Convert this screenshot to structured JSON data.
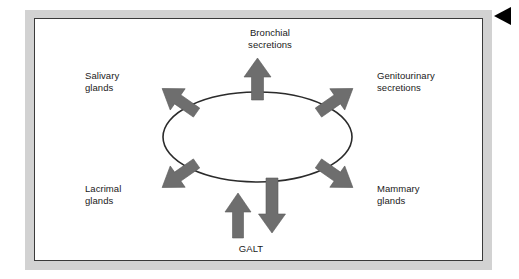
{
  "figure": {
    "type": "radial-diagram",
    "title": "",
    "center_node": {
      "name": "central-ellipse",
      "label": "",
      "shape": "ellipse",
      "fill": "#ffffff",
      "stroke": "#2b2b2b"
    },
    "colors": {
      "arrow_fill": "#6e6e6e",
      "arrow_stroke": "#555555",
      "outline": "#2b2b2b",
      "frame_mat": "#d2d2d2",
      "panel_background": "#ffffff",
      "text": "#1a1a1a",
      "marker": "#000000"
    },
    "marker": {
      "name": "page-edge-marker",
      "shape": "triangle-left",
      "color": "#000000"
    },
    "labels": [
      {
        "id": "bronchial",
        "text": "Bronchial\nsecretions",
        "direction": "up",
        "align": "center"
      },
      {
        "id": "salivary",
        "text": "Salivary\nglands",
        "direction": "up-left",
        "align": "left"
      },
      {
        "id": "genitourinary",
        "text": "Genitourinary\nsecretions",
        "direction": "up-right",
        "align": "left"
      },
      {
        "id": "lacrimal",
        "text": "Lacrimal\nglands",
        "direction": "down-left",
        "align": "left"
      },
      {
        "id": "mammary",
        "text": "Mammary\nglands",
        "direction": "down-right",
        "align": "left"
      },
      {
        "id": "galt",
        "text": "GALT",
        "direction": "up-inbound",
        "align": "center"
      }
    ],
    "arrows": [
      {
        "id": "arrow-up",
        "direction": "up",
        "flow": "outbound"
      },
      {
        "id": "arrow-up-left",
        "direction": "up-left",
        "flow": "outbound"
      },
      {
        "id": "arrow-up-right",
        "direction": "up-right",
        "flow": "outbound"
      },
      {
        "id": "arrow-down-left",
        "direction": "down-left",
        "flow": "outbound"
      },
      {
        "id": "arrow-down-right",
        "direction": "down-right",
        "flow": "outbound"
      },
      {
        "id": "arrow-down",
        "direction": "down",
        "flow": "outbound"
      },
      {
        "id": "arrow-galt-in",
        "direction": "up",
        "flow": "inbound"
      }
    ]
  }
}
